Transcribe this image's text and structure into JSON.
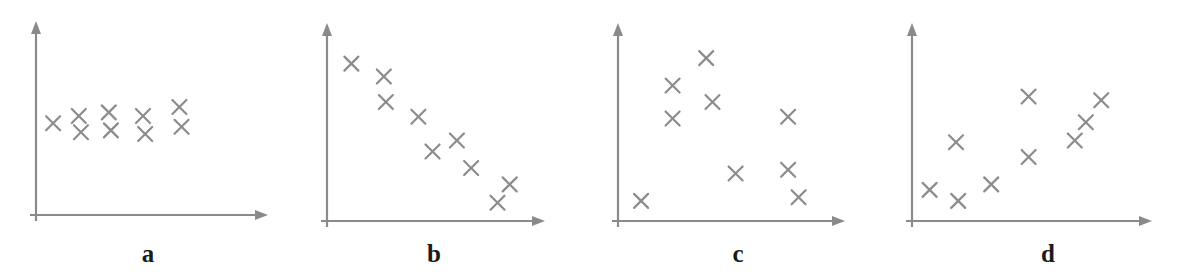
{
  "figure": {
    "width": 1177,
    "height": 276,
    "background_color": "#ffffff",
    "axis_color": "#8a8a8a",
    "marker_color": "#8c8c8c",
    "label_color": "#1a1a1a",
    "marker_glyph": "x-cross-marker"
  },
  "chart_data": [
    {
      "type": "scatter",
      "title": "a",
      "label": "a",
      "description": "no correlation",
      "xlabel": "",
      "ylabel": "",
      "xlim": [
        0,
        100
      ],
      "ylim": [
        0,
        100
      ],
      "grid": false,
      "legend": "none",
      "points": [
        {
          "x": 8,
          "y": 51
        },
        {
          "x": 20,
          "y": 55
        },
        {
          "x": 21,
          "y": 46
        },
        {
          "x": 34,
          "y": 57
        },
        {
          "x": 35,
          "y": 47
        },
        {
          "x": 50,
          "y": 55
        },
        {
          "x": 51,
          "y": 45
        },
        {
          "x": 67,
          "y": 60
        },
        {
          "x": 68,
          "y": 49
        }
      ]
    },
    {
      "type": "scatter",
      "title": "b",
      "label": "b",
      "description": "strong negative correlation",
      "xlabel": "",
      "ylabel": "",
      "xlim": [
        0,
        100
      ],
      "ylim": [
        0,
        100
      ],
      "grid": false,
      "legend": "none",
      "points": [
        {
          "x": 12,
          "y": 86
        },
        {
          "x": 28,
          "y": 79
        },
        {
          "x": 29,
          "y": 65
        },
        {
          "x": 45,
          "y": 57
        },
        {
          "x": 64,
          "y": 44
        },
        {
          "x": 52,
          "y": 38
        },
        {
          "x": 71,
          "y": 29
        },
        {
          "x": 90,
          "y": 20
        },
        {
          "x": 84,
          "y": 10
        }
      ]
    },
    {
      "type": "scatter",
      "title": "c",
      "label": "c",
      "description": "no correlation / scattered",
      "xlabel": "",
      "ylabel": "",
      "xlim": [
        0,
        100
      ],
      "ylim": [
        0,
        100
      ],
      "grid": false,
      "legend": "none",
      "points": [
        {
          "x": 42,
          "y": 89
        },
        {
          "x": 26,
          "y": 74
        },
        {
          "x": 45,
          "y": 65
        },
        {
          "x": 26,
          "y": 56
        },
        {
          "x": 81,
          "y": 57
        },
        {
          "x": 56,
          "y": 26
        },
        {
          "x": 81,
          "y": 28
        },
        {
          "x": 11,
          "y": 11
        },
        {
          "x": 86,
          "y": 13
        }
      ]
    },
    {
      "type": "scatter",
      "title": "d",
      "label": "d",
      "description": "positive correlation",
      "xlabel": "",
      "ylabel": "",
      "xlim": [
        0,
        100
      ],
      "ylim": [
        0,
        100
      ],
      "grid": false,
      "legend": "none",
      "points": [
        {
          "x": 8,
          "y": 17
        },
        {
          "x": 21,
          "y": 11
        },
        {
          "x": 36,
          "y": 20
        },
        {
          "x": 20,
          "y": 43
        },
        {
          "x": 53,
          "y": 35
        },
        {
          "x": 53,
          "y": 68
        },
        {
          "x": 74,
          "y": 44
        },
        {
          "x": 79,
          "y": 54
        },
        {
          "x": 86,
          "y": 66
        }
      ]
    }
  ],
  "panels": {
    "a": {
      "label": "a"
    },
    "b": {
      "label": "b"
    },
    "c": {
      "label": "c"
    },
    "d": {
      "label": "d"
    }
  }
}
